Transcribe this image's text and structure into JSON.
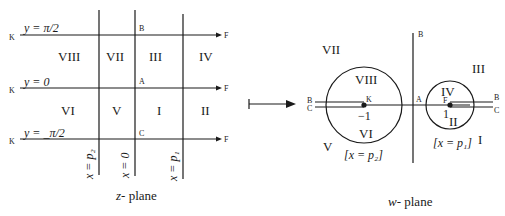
{
  "z_plane": {
    "caption_var": "z",
    "caption_rest": "- plane",
    "horizontal_lines": [
      {
        "label": "y = π/2",
        "left_point": "K",
        "right_point": "F"
      },
      {
        "label": "y = 0",
        "left_point": "K",
        "right_point": "F"
      },
      {
        "label": "y = _π/2",
        "left_point": "K",
        "right_point": "F"
      }
    ],
    "vertical_lines": [
      {
        "label": "x = p₂"
      },
      {
        "label": "x = 0"
      },
      {
        "label": "x = p₁"
      }
    ],
    "points": {
      "B": "B",
      "A": "A",
      "C": "C"
    },
    "regions_top": [
      "VIII",
      "VII",
      "III",
      "IV"
    ],
    "regions_bottom": [
      "VI",
      "V",
      "I",
      "II"
    ]
  },
  "mapping_arrow": "maps-to",
  "w_plane": {
    "caption_var": "w",
    "caption_rest": "- plane",
    "points": {
      "B_axis": "B",
      "A": "A",
      "K": "K",
      "F": "F",
      "B_left": "B",
      "C_left": "C",
      "B_right": "B",
      "C_right": "C"
    },
    "values": {
      "minus_one": "−1",
      "one": "1"
    },
    "regions": {
      "VII": "VII",
      "VIII": "VIII",
      "VI": "VI",
      "V": "V",
      "III": "III",
      "IV": "IV",
      "II": "II",
      "I": "I"
    },
    "circle_labels": {
      "left": "[x = p₂]",
      "right": "[x = p₁]"
    }
  }
}
